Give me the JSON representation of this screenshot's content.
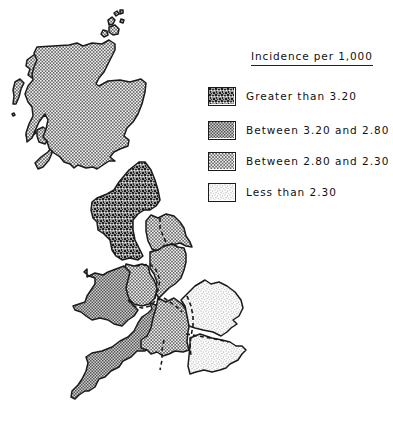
{
  "legend": {
    "title": "Incidence per 1,000",
    "items": [
      {
        "label": "Greater than 3.20",
        "pattern": "pat-high",
        "fill": "#6a6a6a"
      },
      {
        "label": "Between 3.20 and 2.80",
        "pattern": "pat-midhigh",
        "fill": "#9a9a9a"
      },
      {
        "label": "Between 2.80 and 2.30",
        "pattern": "pat-midlow",
        "fill": "#c4c4c4"
      },
      {
        "label": "Less than 2.30",
        "pattern": "pat-low",
        "fill": "#e6e6e6"
      }
    ]
  },
  "map": {
    "outline_color": "#1a1a1a",
    "boundary_style": "dashed",
    "regions": [
      {
        "id": "scotland",
        "category": 2
      },
      {
        "id": "north",
        "category": 0
      },
      {
        "id": "yorkshire",
        "category": 2
      },
      {
        "id": "east-midlands",
        "category": 2
      },
      {
        "id": "west-midlands",
        "category": 2
      },
      {
        "id": "wales",
        "category": 1
      },
      {
        "id": "south-west",
        "category": 1
      },
      {
        "id": "south-central",
        "category": 2
      },
      {
        "id": "east-anglia",
        "category": 3
      },
      {
        "id": "south-east",
        "category": 3
      }
    ]
  }
}
